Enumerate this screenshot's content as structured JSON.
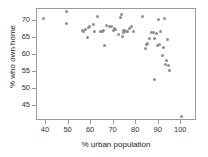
{
  "chart_data": {
    "type": "scatter",
    "title": "",
    "xlabel": "% urban population",
    "ylabel": "% who own home",
    "xlim": [
      36,
      107
    ],
    "ylim": [
      40.5,
      73.7
    ],
    "xticks": [
      40,
      50,
      60,
      70,
      80,
      90,
      100
    ],
    "yticks": [
      45,
      50,
      55,
      60,
      65,
      70
    ],
    "grid": false,
    "legend": null,
    "marker_color": "#8e8e8e",
    "axis_color": "#9a9a9a",
    "series": [
      {
        "name": "states",
        "x": [
          39.0,
          49.0,
          49.3,
          56.0,
          56.7,
          57.5,
          58.3,
          59.0,
          59.3,
          61.0,
          61.3,
          63.0,
          64.0,
          65.0,
          65.3,
          66.0,
          67.0,
          68.0,
          69.0,
          70.0,
          70.5,
          71.0,
          72.0,
          73.0,
          73.5,
          74.0,
          74.3,
          74.6,
          75.0,
          75.5,
          76.0,
          77.0,
          78.0,
          79.0,
          83.0,
          84.0,
          84.5,
          85.0,
          86.0,
          87.0,
          87.5,
          88.0,
          88.3,
          89.0,
          89.5,
          90.0,
          90.5,
          91.0,
          91.5,
          92.0,
          92.5,
          93.0,
          93.5,
          94.0,
          94.5,
          95.0,
          100.0
        ],
        "y": [
          70.9,
          73.0,
          69.5,
          67.3,
          67.0,
          67.6,
          65.3,
          68.2,
          68.6,
          69.2,
          67.0,
          71.6,
          67.0,
          66.9,
          67.2,
          62.9,
          68.8,
          68.6,
          68.4,
          67.3,
          68.0,
          67.5,
          66.0,
          71.3,
          72.0,
          65.6,
          67.4,
          66.8,
          67.3,
          67.1,
          66.9,
          68.0,
          68.4,
          67.0,
          71.6,
          61.9,
          63.2,
          63.4,
          65.1,
          66.8,
          66.6,
          52.9,
          64.9,
          66.3,
          62.9,
          70.5,
          63.3,
          66.9,
          60.0,
          62.2,
          71.0,
          57.3,
          58.5,
          64.8,
          56.9,
          55.4,
          41.9
        ]
      }
    ]
  },
  "figure": {
    "plot_left": 36,
    "plot_top": 8,
    "plot_width": 160,
    "plot_height": 112
  }
}
